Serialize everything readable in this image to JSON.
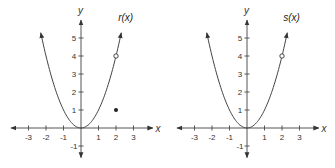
{
  "chart_data": [
    {
      "type": "line",
      "title": "r(x)",
      "function_label": "r(x)",
      "xlabel": "x",
      "ylabel": "y",
      "xlim": [
        -3.5,
        3.5
      ],
      "ylim": [
        -1.5,
        5.5
      ],
      "x_ticks": [
        -3,
        -2,
        -1,
        1,
        2,
        3
      ],
      "y_ticks": [
        -1,
        1,
        2,
        3,
        4,
        5
      ],
      "grid": false,
      "series": [
        {
          "name": "r(x) = x^2 (x != 2)",
          "formula": "x^2",
          "x_range": [
            -2.3,
            2.3
          ],
          "arrows_at_ends": true
        }
      ],
      "points": [
        {
          "x": 2,
          "y": 4,
          "style": "open"
        },
        {
          "x": 2,
          "y": 1,
          "style": "filled"
        }
      ]
    },
    {
      "type": "line",
      "title": "s(x)",
      "function_label": "s(x)",
      "xlabel": "x",
      "ylabel": "y",
      "xlim": [
        -3.5,
        3.5
      ],
      "ylim": [
        -1.5,
        5.5
      ],
      "x_ticks": [
        -3,
        -2,
        -1,
        1,
        2,
        3
      ],
      "y_ticks": [
        -1,
        1,
        2,
        3,
        4,
        5
      ],
      "grid": false,
      "series": [
        {
          "name": "s(x) = x^2 (x != 2)",
          "formula": "x^2",
          "x_range": [
            -2.3,
            2.3
          ],
          "arrows_at_ends": true
        }
      ],
      "points": [
        {
          "x": 2,
          "y": 4,
          "style": "open"
        }
      ]
    }
  ],
  "panels": [
    {
      "function_label": "r(x)",
      "xlabel": "x",
      "ylabel": "y",
      "x_tick_labels": [
        "-3",
        "-2",
        "-1",
        "1",
        "2",
        "3"
      ],
      "y_tick_labels": [
        "-1",
        "1",
        "2",
        "3",
        "4",
        "5"
      ]
    },
    {
      "function_label": "s(x)",
      "xlabel": "x",
      "ylabel": "y",
      "x_tick_labels": [
        "-3",
        "-2",
        "-1",
        "1",
        "2",
        "3"
      ],
      "y_tick_labels": [
        "-1",
        "1",
        "2",
        "3",
        "4",
        "5"
      ]
    }
  ]
}
